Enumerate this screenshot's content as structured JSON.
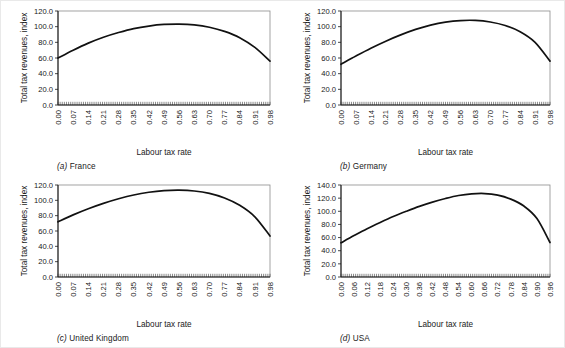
{
  "figure": {
    "panels": [
      {
        "id": "france",
        "caption_letter": "(a)",
        "caption_text": "France",
        "ylabel": "Total tax revenues, index",
        "xlabel": "Labour tax rate"
      },
      {
        "id": "germany",
        "caption_letter": "(b)",
        "caption_text": "Germany",
        "ylabel": "Total tax revenues, index",
        "xlabel": "Labour tax rate"
      },
      {
        "id": "united-kingdom",
        "caption_letter": "(c)",
        "caption_text": "United Kingdom",
        "ylabel": "Total tax revenues, index",
        "xlabel": "Labour tax rate"
      },
      {
        "id": "usa",
        "caption_letter": "(d)",
        "caption_text": "USA",
        "ylabel": "Total tax revenues, index",
        "xlabel": "Labour tax rate"
      }
    ]
  },
  "chart_data": [
    {
      "type": "line",
      "id": "france",
      "title": "(a) France",
      "xlabel": "Labour tax rate",
      "ylabel": "Total tax revenues, index",
      "xlim": [
        0.0,
        0.98
      ],
      "ylim": [
        0.0,
        120.0
      ],
      "yticks": [
        0.0,
        20.0,
        40.0,
        60.0,
        80.0,
        100.0,
        120.0
      ],
      "ytick_labels": [
        "0.0",
        "20.0",
        "40.0",
        "60.0",
        "80.0",
        "100.0",
        "120.0"
      ],
      "xticks": [
        0.0,
        0.07,
        0.14,
        0.21,
        0.28,
        0.35,
        0.42,
        0.49,
        0.56,
        0.63,
        0.7,
        0.77,
        0.84,
        0.91,
        0.98
      ],
      "xtick_labels": [
        "0.00",
        "0.07",
        "0.14",
        "0.21",
        "0.28",
        "0.35",
        "0.42",
        "0.49",
        "0.56",
        "0.63",
        "0.70",
        "0.77",
        "0.84",
        "0.91",
        "0.98"
      ],
      "grid": false,
      "legend": "none",
      "x": [
        0.0,
        0.07,
        0.14,
        0.21,
        0.28,
        0.35,
        0.42,
        0.49,
        0.56,
        0.63,
        0.7,
        0.77,
        0.84,
        0.91,
        0.98
      ],
      "y": [
        60.0,
        70.0,
        79.0,
        86.5,
        92.5,
        97.5,
        100.8,
        102.8,
        103.3,
        102.3,
        99.3,
        94.0,
        86.0,
        73.5,
        56.0
      ],
      "peak": {
        "x": 0.58,
        "y": 103.4
      }
    },
    {
      "type": "line",
      "id": "germany",
      "title": "(b) Germany",
      "xlabel": "Labour tax rate",
      "ylabel": "Total tax revenues, index",
      "xlim": [
        0.0,
        0.98
      ],
      "ylim": [
        0.0,
        120.0
      ],
      "yticks": [
        0.0,
        20.0,
        40.0,
        60.0,
        80.0,
        100.0,
        120.0
      ],
      "ytick_labels": [
        "0.0",
        "20.0",
        "40.0",
        "60.0",
        "80.0",
        "100.0",
        "120.0"
      ],
      "xticks": [
        0.0,
        0.07,
        0.14,
        0.21,
        0.28,
        0.35,
        0.42,
        0.49,
        0.56,
        0.63,
        0.7,
        0.77,
        0.84,
        0.91,
        0.98
      ],
      "xtick_labels": [
        "0.00",
        "0.07",
        "0.14",
        "0.21",
        "0.28",
        "0.35",
        "0.42",
        "0.49",
        "0.56",
        "0.63",
        "0.70",
        "0.77",
        "0.84",
        "0.91",
        "0.98"
      ],
      "grid": false,
      "legend": "none",
      "x": [
        0.0,
        0.07,
        0.14,
        0.21,
        0.28,
        0.35,
        0.42,
        0.49,
        0.56,
        0.63,
        0.7,
        0.77,
        0.84,
        0.91,
        0.98
      ],
      "y": [
        52.0,
        62.5,
        72.5,
        81.5,
        89.5,
        96.5,
        102.0,
        105.8,
        107.8,
        108.0,
        106.0,
        101.5,
        93.5,
        80.0,
        56.0
      ],
      "peak": {
        "x": 0.61,
        "y": 108.1
      }
    },
    {
      "type": "line",
      "id": "united-kingdom",
      "title": "(c) United Kingdom",
      "xlabel": "Labour tax rate",
      "ylabel": "Total tax revenues, index",
      "xlim": [
        0.0,
        0.98
      ],
      "ylim": [
        0.0,
        120.0
      ],
      "yticks": [
        0.0,
        20.0,
        40.0,
        60.0,
        80.0,
        100.0,
        120.0
      ],
      "ytick_labels": [
        "0.0",
        "20.0",
        "40.0",
        "60.0",
        "80.0",
        "100.0",
        "120.0"
      ],
      "xticks": [
        0.0,
        0.07,
        0.14,
        0.21,
        0.28,
        0.35,
        0.42,
        0.49,
        0.56,
        0.63,
        0.7,
        0.77,
        0.84,
        0.91,
        0.98
      ],
      "xtick_labels": [
        "0.00",
        "0.07",
        "0.14",
        "0.21",
        "0.28",
        "0.35",
        "0.42",
        "0.49",
        "0.56",
        "0.63",
        "0.70",
        "0.77",
        "0.84",
        "0.91",
        "0.98"
      ],
      "grid": false,
      "legend": "none",
      "x": [
        0.0,
        0.07,
        0.14,
        0.21,
        0.28,
        0.35,
        0.42,
        0.49,
        0.56,
        0.63,
        0.7,
        0.77,
        0.84,
        0.91,
        0.98
      ],
      "y": [
        72.0,
        81.0,
        89.0,
        96.0,
        102.0,
        107.0,
        110.5,
        112.6,
        113.2,
        112.2,
        109.0,
        103.0,
        93.5,
        78.5,
        53.5
      ],
      "peak": {
        "x": 0.57,
        "y": 113.3
      }
    },
    {
      "type": "line",
      "id": "usa",
      "title": "(d) USA",
      "xlabel": "Labour tax rate",
      "ylabel": "Total tax revenues, index",
      "xlim": [
        0.0,
        0.96
      ],
      "ylim": [
        0.0,
        140.0
      ],
      "yticks": [
        0.0,
        20.0,
        40.0,
        60.0,
        80.0,
        100.0,
        120.0,
        140.0
      ],
      "ytick_labels": [
        "0.0",
        "20.0",
        "40.0",
        "60.0",
        "80.0",
        "100.0",
        "120.0",
        "140.0"
      ],
      "xticks": [
        0.0,
        0.06,
        0.12,
        0.18,
        0.24,
        0.3,
        0.36,
        0.42,
        0.48,
        0.54,
        0.6,
        0.66,
        0.72,
        0.78,
        0.84,
        0.9,
        0.96
      ],
      "xtick_labels": [
        "0.00",
        "0.06",
        "0.12",
        "0.18",
        "0.24",
        "0.30",
        "0.36",
        "0.42",
        "0.48",
        "0.54",
        "0.60",
        "0.66",
        "0.72",
        "0.78",
        "0.84",
        "0.90",
        "0.96"
      ],
      "grid": false,
      "legend": "none",
      "x": [
        0.0,
        0.06,
        0.12,
        0.18,
        0.24,
        0.3,
        0.36,
        0.42,
        0.48,
        0.54,
        0.6,
        0.66,
        0.72,
        0.78,
        0.84,
        0.9,
        0.96
      ],
      "y": [
        52.0,
        63.0,
        73.5,
        83.0,
        92.0,
        100.0,
        107.5,
        114.0,
        119.5,
        124.0,
        126.5,
        127.0,
        124.5,
        118.5,
        108.0,
        89.0,
        52.5
      ],
      "peak": {
        "x": 0.63,
        "y": 127.2
      }
    }
  ]
}
